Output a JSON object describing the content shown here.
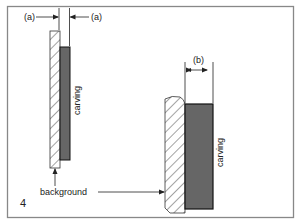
{
  "figure": {
    "number": "4",
    "colors": {
      "frame": "#888888",
      "carving_fill": "#666666",
      "carving_stroke": "#111111",
      "hatch": "#333333",
      "line": "#222222"
    }
  },
  "left_piece": {
    "dimension_left_label": "(a)",
    "dimension_right_label": "(a)",
    "carving_label": "carving"
  },
  "right_piece": {
    "dimension_label": "(b)",
    "carving_label": "carving"
  },
  "labels": {
    "background": "background"
  }
}
